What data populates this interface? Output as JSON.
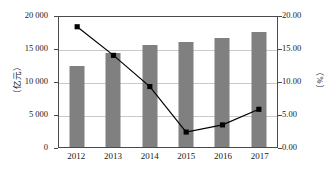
{
  "chart_data": {
    "type": "bar",
    "title": "",
    "subtitle": "",
    "categories": [
      "2012",
      "2013",
      "2014",
      "2015",
      "2016",
      "2017"
    ],
    "series": [
      {
        "name": "金额",
        "type": "bar",
        "axis": "left",
        "values": [
          12300,
          14200,
          15500,
          15900,
          16500,
          17500
        ],
        "color": "#808080"
      },
      {
        "name": "增长率",
        "type": "line",
        "axis": "right",
        "values": [
          18.5,
          14.1,
          9.3,
          2.3,
          3.4,
          5.8
        ],
        "color": "#000000"
      }
    ],
    "xlabel": "",
    "ylabel": "（亿元）",
    "y2label": "（%）",
    "ylim": [
      0,
      20000
    ],
    "y2lim": [
      0,
      20.0
    ],
    "yticks": [
      "0",
      "5 000",
      "10 000",
      "15 000",
      "20 000"
    ],
    "ytick_values": [
      0,
      5000,
      10000,
      15000,
      20000
    ],
    "y2ticks": [
      "0.00",
      "5.00",
      "10.00",
      "15.00",
      "20.00"
    ],
    "y2tick_values": [
      0,
      5,
      10,
      15,
      20
    ],
    "grid": true,
    "legend": "none"
  }
}
